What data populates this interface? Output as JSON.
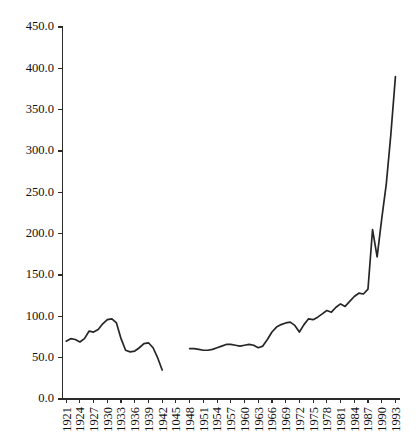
{
  "chart_data": {
    "type": "line",
    "title": "",
    "subtitle": "",
    "xlabel": "",
    "ylabel": "",
    "grid": false,
    "legend": false,
    "legend_position": "none",
    "xlim": [
      1920.2,
      1994.0
    ],
    "ylim": [
      0,
      450
    ],
    "yticks": [
      0,
      50,
      100,
      150,
      200,
      250,
      300,
      350,
      400,
      450
    ],
    "ytick_labels": [
      "0.0",
      "50.0",
      "100.0",
      "150.0",
      "200.0",
      "250.0",
      "300.0",
      "350.0",
      "400.0",
      "450.0"
    ],
    "xtick_labels": [
      "1921",
      "1924",
      "1927",
      "1930",
      "1933",
      "1936",
      "1939",
      "1942",
      "1045",
      "1948",
      "1951",
      "1954",
      "1957",
      "1960",
      "1963",
      "1966",
      "1969",
      "1972",
      "1975",
      "1978",
      "1981",
      "1984",
      "1987",
      "1990",
      "1993"
    ],
    "xtick_values": [
      1921,
      1924,
      1927,
      1930,
      1933,
      1936,
      1939,
      1942,
      1945,
      1948,
      1951,
      1954,
      1957,
      1960,
      1963,
      1966,
      1969,
      1972,
      1975,
      1978,
      1981,
      1984,
      1987,
      1990,
      1993
    ],
    "xtick_rotation": 90,
    "line_color": "#262626",
    "series": [
      {
        "name": "series-1",
        "gap_note": "no data 1943-1947",
        "x": [
          1921,
          1922,
          1923,
          1924,
          1925,
          1926,
          1927,
          1928,
          1929,
          1930,
          1931,
          1932,
          1933,
          1934,
          1935,
          1936,
          1937,
          1938,
          1939,
          1940,
          1941,
          1942
        ],
        "values": [
          70,
          73,
          72,
          69,
          73,
          82,
          81,
          84,
          91,
          96,
          97,
          92,
          73,
          59,
          57,
          58,
          62,
          67,
          68,
          62,
          50,
          35
        ]
      },
      {
        "name": "series-2",
        "gap_note": "resumes after WWII",
        "x": [
          1948,
          1949,
          1950,
          1951,
          1952,
          1953,
          1954,
          1955,
          1956,
          1957,
          1958,
          1959,
          1960,
          1961,
          1962,
          1963,
          1964,
          1965,
          1966,
          1967,
          1968,
          1969,
          1970,
          1971,
          1972,
          1973,
          1974,
          1975,
          1976,
          1977,
          1978,
          1979,
          1980,
          1981,
          1982,
          1983,
          1984,
          1985,
          1986,
          1987,
          1988,
          1989,
          1990,
          1991,
          1992,
          1993
        ],
        "values": [
          61,
          61,
          60,
          59,
          59,
          60,
          62,
          64,
          66,
          66,
          65,
          64,
          65,
          66,
          65,
          62,
          64,
          72,
          81,
          87,
          90,
          92,
          93,
          89,
          81,
          90,
          97,
          96,
          99,
          103,
          107,
          105,
          111,
          115,
          112,
          118,
          124,
          128,
          127,
          133,
          205,
          172,
          218,
          260,
          320,
          390
        ]
      }
    ]
  },
  "axes": {
    "y_axis_name": "y-axis",
    "x_axis_name": "x-axis"
  }
}
